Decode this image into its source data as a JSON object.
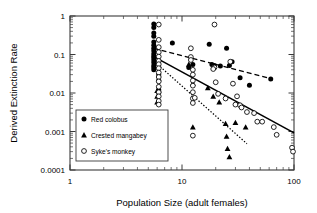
{
  "chart_data": {
    "type": "scatter",
    "title": "",
    "xlabel": "Population Size (adult females)",
    "ylabel": "Derived Extinction Rate",
    "xscale": "log",
    "yscale": "log",
    "xlim": [
      1,
      100
    ],
    "ylim": [
      0.0001,
      1
    ],
    "xticks": [
      "1",
      "10",
      "100"
    ],
    "xtick_values": [
      1,
      10,
      100
    ],
    "yticks": [
      "1",
      "0.1",
      "0.01",
      "0.001",
      "0.0001"
    ],
    "ytick_values": [
      1,
      0.1,
      0.01,
      0.001,
      0.0001
    ],
    "grid": false,
    "legend_position": "lower-left-inside",
    "series": [
      {
        "name": "Red colobus",
        "marker": "filled-circle",
        "color": "#000000",
        "points": [
          [
            5.6,
            0.62
          ],
          [
            5.6,
            0.5
          ],
          [
            5.6,
            0.36
          ],
          [
            5.6,
            0.3
          ],
          [
            5.6,
            0.21
          ],
          [
            5.6,
            0.175
          ],
          [
            5.6,
            0.145
          ],
          [
            5.6,
            0.125
          ],
          [
            5.6,
            0.105
          ],
          [
            5.6,
            0.092
          ],
          [
            5.6,
            0.082
          ],
          [
            5.6,
            0.072
          ],
          [
            5.6,
            0.062
          ],
          [
            5.6,
            0.052
          ],
          [
            5.6,
            0.046
          ],
          [
            5.6,
            0.04
          ],
          [
            6.2,
            0.03
          ],
          [
            6.2,
            0.021
          ],
          [
            6.2,
            0.012
          ],
          [
            6.2,
            0.0105
          ],
          [
            8.2,
            0.2
          ],
          [
            11.5,
            0.046
          ],
          [
            12.5,
            0.055
          ],
          [
            17.5,
            0.185
          ],
          [
            18.5,
            0.055
          ],
          [
            19.5,
            0.052
          ],
          [
            22.0,
            0.05
          ],
          [
            25.0,
            0.145
          ],
          [
            26.5,
            0.052
          ],
          [
            28.0,
            0.065
          ],
          [
            33.0,
            0.025
          ],
          [
            40.0,
            0.016
          ],
          [
            62.0,
            0.023
          ]
        ]
      },
      {
        "name": "Crested mangabey",
        "marker": "filled-triangle",
        "color": "#000000",
        "points": [
          [
            6.0,
            0.0115
          ],
          [
            6.0,
            0.0082
          ],
          [
            6.0,
            0.0058
          ],
          [
            6.2,
            0.00072
          ],
          [
            11.5,
            0.055
          ],
          [
            12.5,
            0.0175
          ],
          [
            12.5,
            0.0013
          ],
          [
            17.0,
            0.0135
          ],
          [
            19.0,
            0.0082
          ],
          [
            21.5,
            0.0058
          ],
          [
            24.5,
            0.0016
          ],
          [
            25.0,
            0.00075
          ],
          [
            25.5,
            0.00036
          ],
          [
            26.5,
            0.00022
          ],
          [
            30.0,
            0.0017
          ],
          [
            37.0,
            0.0013
          ]
        ]
      },
      {
        "name": "Syke's monkey",
        "marker": "open-circle",
        "color": "#000000",
        "points": [
          [
            6.2,
            0.6
          ],
          [
            6.2,
            0.24
          ],
          [
            6.2,
            0.155
          ],
          [
            6.2,
            0.115
          ],
          [
            6.2,
            0.088
          ],
          [
            6.2,
            0.068
          ],
          [
            6.2,
            0.056
          ],
          [
            6.2,
            0.044
          ],
          [
            6.2,
            0.034
          ],
          [
            6.2,
            0.026
          ],
          [
            6.2,
            0.02
          ],
          [
            6.2,
            0.0145
          ],
          [
            6.2,
            0.0105
          ],
          [
            6.2,
            0.0082
          ],
          [
            6.2,
            0.0062
          ],
          [
            6.2,
            0.005
          ],
          [
            12.0,
            0.145
          ],
          [
            12.0,
            0.086
          ],
          [
            12.0,
            0.072
          ],
          [
            12.5,
            0.04
          ],
          [
            12.5,
            0.03
          ],
          [
            12.5,
            0.021
          ],
          [
            12.5,
            0.0155
          ],
          [
            12.5,
            0.0105
          ],
          [
            12.5,
            0.0072
          ],
          [
            12.5,
            0.0055
          ],
          [
            13.0,
            0.0075
          ],
          [
            12.5,
            0.00078
          ],
          [
            19.5,
            0.6
          ],
          [
            19.5,
            0.046
          ],
          [
            19.0,
            0.042
          ],
          [
            20.0,
            0.019
          ],
          [
            21.0,
            0.0095
          ],
          [
            24.5,
            0.0072
          ],
          [
            27.0,
            0.065
          ],
          [
            28.5,
            0.0175
          ],
          [
            30.0,
            0.005
          ],
          [
            31.0,
            0.0082
          ],
          [
            33.0,
            0.0048
          ],
          [
            34.0,
            0.0042
          ],
          [
            38.0,
            0.0032
          ],
          [
            44.0,
            0.003
          ],
          [
            47.0,
            0.0018
          ],
          [
            52.0,
            0.0018
          ],
          [
            66.0,
            0.0013
          ],
          [
            70.0,
            0.00082
          ],
          [
            96.0,
            0.00038
          ],
          [
            98.0,
            0.0003
          ]
        ]
      }
    ],
    "trend_lines": [
      {
        "name": "Red colobus regression",
        "style": "dashed",
        "x_start": 5.6,
        "y_start": 0.145,
        "x_end": 64.0,
        "y_end": 0.023
      },
      {
        "name": "Syke's monkey regression",
        "style": "solid",
        "x_start": 5.6,
        "y_start": 0.088,
        "x_end": 100.0,
        "y_end": 0.00092
      },
      {
        "name": "Crested mangabey regression",
        "style": "dotted",
        "x_start": 5.8,
        "y_start": 0.062,
        "x_end": 38.0,
        "y_end": 0.00048
      }
    ]
  },
  "legend": {
    "entries": [
      {
        "label": "Red colobus",
        "marker": "filled-circle"
      },
      {
        "label": "Crested mangabey",
        "marker": "filled-triangle"
      },
      {
        "label": "Syke's monkey",
        "marker": "open-circle"
      }
    ]
  },
  "colors": {
    "axis": "#3a3a3a",
    "marker": "#000000",
    "background": "#ffffff"
  }
}
